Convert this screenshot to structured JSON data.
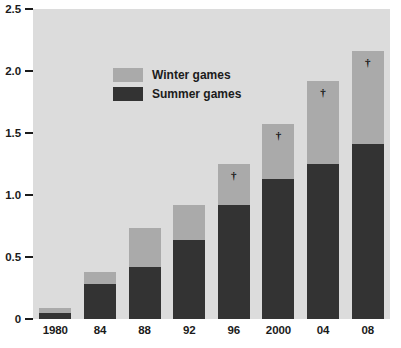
{
  "chart_data": {
    "type": "bar",
    "subtype": "stacked",
    "title": "",
    "xlabel": "",
    "ylabel": "",
    "categories": [
      "1980",
      "84",
      "88",
      "92",
      "96",
      "2000",
      "04",
      "08"
    ],
    "series": [
      {
        "name": "Summer games",
        "color": "#333333",
        "values": [
          0.05,
          0.28,
          0.42,
          0.64,
          0.92,
          1.13,
          1.25,
          1.41
        ]
      },
      {
        "name": "Winter games",
        "color": "#aaaaaa",
        "values": [
          0.04,
          0.1,
          0.31,
          0.28,
          0.33,
          0.44,
          0.67,
          0.75
        ]
      }
    ],
    "totals": [
      0.09,
      0.38,
      0.73,
      0.92,
      1.25,
      1.57,
      1.92,
      2.16
    ],
    "ylim": [
      0,
      2.5
    ],
    "yticks": [
      0,
      0.5,
      1.0,
      1.5,
      2.0,
      2.5
    ],
    "ytick_labels": [
      "0",
      "0.5",
      "1.0",
      "1.5",
      "2.0",
      "2.5"
    ],
    "grid": false,
    "legend_position": "upper-left-inside",
    "annotations": [
      {
        "category": "96",
        "symbol": "†"
      },
      {
        "category": "2000",
        "symbol": "†"
      },
      {
        "category": "04",
        "symbol": "†"
      },
      {
        "category": "08",
        "symbol": "†"
      }
    ],
    "plot_background": "#dcdcdc"
  },
  "legend": {
    "items": [
      {
        "label": "Winter games",
        "color": "#aaaaaa"
      },
      {
        "label": "Summer games",
        "color": "#333333"
      }
    ]
  }
}
